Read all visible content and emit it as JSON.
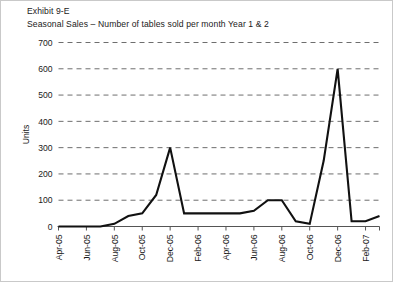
{
  "figure": {
    "exhibit_label": "Exhibit 9-E",
    "caption": "Seasonal Sales – Number of tables sold per month Year 1 & 2"
  },
  "chart_data": {
    "type": "line",
    "title": "Seasonal Sales – Number of tables sold per month Year 1 & 2",
    "subtitle": "Exhibit 9-E",
    "xlabel": "",
    "ylabel": "Units",
    "ylim": [
      0,
      700
    ],
    "yticks": [
      0,
      100,
      200,
      300,
      400,
      500,
      600,
      700
    ],
    "ytick_labels": [
      "0",
      "100",
      "200",
      "300",
      "400",
      "500",
      "600",
      "700"
    ],
    "grid": true,
    "grid_style": "dashed-horizontal",
    "legend": "none",
    "line_color": "#111111",
    "categories": [
      "Apr-05",
      "May-05",
      "Jun-05",
      "Jul-05",
      "Aug-05",
      "Sep-05",
      "Oct-05",
      "Nov-05",
      "Dec-05",
      "Jan-06",
      "Feb-06",
      "Mar-06",
      "Apr-06",
      "May-06",
      "Jun-06",
      "Jul-06",
      "Aug-06",
      "Sep-06",
      "Oct-06",
      "Nov-06",
      "Dec-06",
      "Jan-07",
      "Feb-07",
      "Mar-07"
    ],
    "xtick_labels": [
      "Apr-05",
      "Jun-05",
      "Aug-05",
      "Oct-05",
      "Dec-05",
      "Feb-06",
      "Apr-06",
      "Jun-06",
      "Aug-06",
      "Oct-06",
      "Dec-06",
      "Feb-07"
    ],
    "values": [
      0,
      0,
      0,
      0,
      10,
      40,
      50,
      120,
      300,
      50,
      50,
      50,
      50,
      50,
      60,
      100,
      100,
      20,
      10,
      250,
      600,
      20,
      20,
      40
    ],
    "series": [
      {
        "name": "Units",
        "values": [
          0,
          0,
          0,
          0,
          10,
          40,
          50,
          120,
          300,
          50,
          50,
          50,
          50,
          50,
          60,
          100,
          100,
          20,
          10,
          250,
          600,
          20,
          20,
          40
        ]
      }
    ],
    "annotations": [
      {
        "label": "Year 1 holiday peak",
        "category": "Dec-05",
        "value": 300
      },
      {
        "label": "Year 2 holiday peak",
        "category": "Dec-06",
        "value": 600
      }
    ]
  }
}
